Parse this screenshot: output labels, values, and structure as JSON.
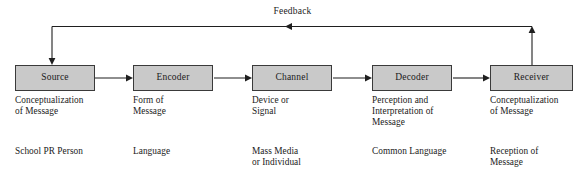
{
  "diagram": {
    "feedback_label": "Feedback",
    "stages": [
      {
        "id": "source",
        "box_label": "Source",
        "description": "Conceptualization\nof Message",
        "example": "School PR Person"
      },
      {
        "id": "encoder",
        "box_label": "Encoder",
        "description": "Form of\nMessage",
        "example": "Language"
      },
      {
        "id": "channel",
        "box_label": "Channel",
        "description": "Device or\nSignal",
        "example": "Mass Media\nor Individual"
      },
      {
        "id": "decoder",
        "box_label": "Decoder",
        "description": "Perception and\nInterpretation of\nMessage",
        "example": "Common Language"
      },
      {
        "id": "receiver",
        "box_label": "Receiver",
        "description": "Conceptualization\nof Message",
        "example": "Reception of\nMessage"
      }
    ],
    "colors": {
      "box_fill": "#c9c9c9",
      "box_border": "#3a3a3a",
      "line": "#1f1f1f",
      "text": "#1a1a1a",
      "background": "#ffffff"
    }
  }
}
